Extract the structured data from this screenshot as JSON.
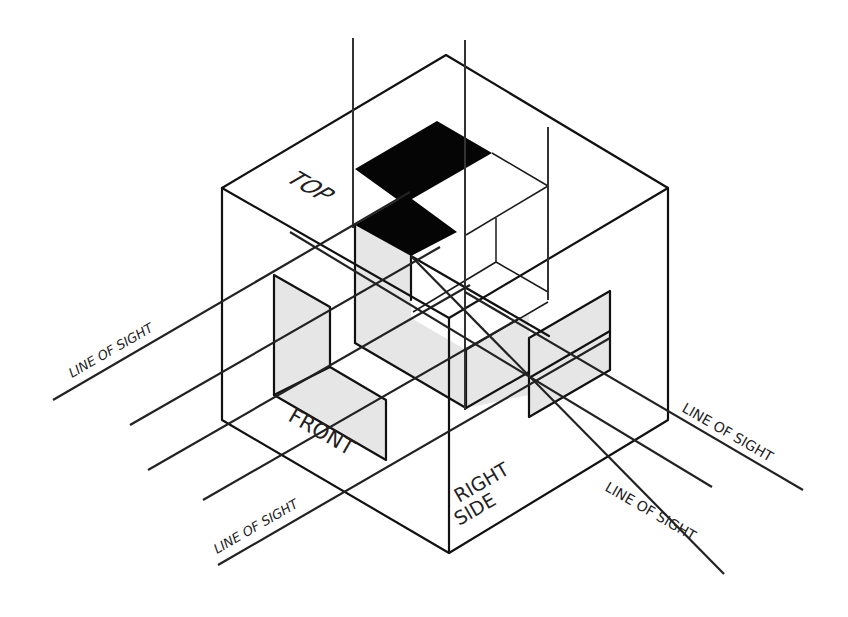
{
  "diagram": {
    "labels": {
      "top": "TOP",
      "front": "FRONT",
      "right_side_line1": "RIGHT",
      "right_side_line2": "SIDE",
      "line_of_sight_left": "LINE OF SIGHT",
      "line_of_sight_front": "LINE OF SIGHT",
      "line_of_sight_right_upper": "LINE OF SIGHT",
      "line_of_sight_right_lower": "LINE OF SIGHT"
    },
    "colors": {
      "line": "#111111",
      "shade": "#e6e6e6",
      "solid": "#050505",
      "background": "#ffffff"
    }
  }
}
